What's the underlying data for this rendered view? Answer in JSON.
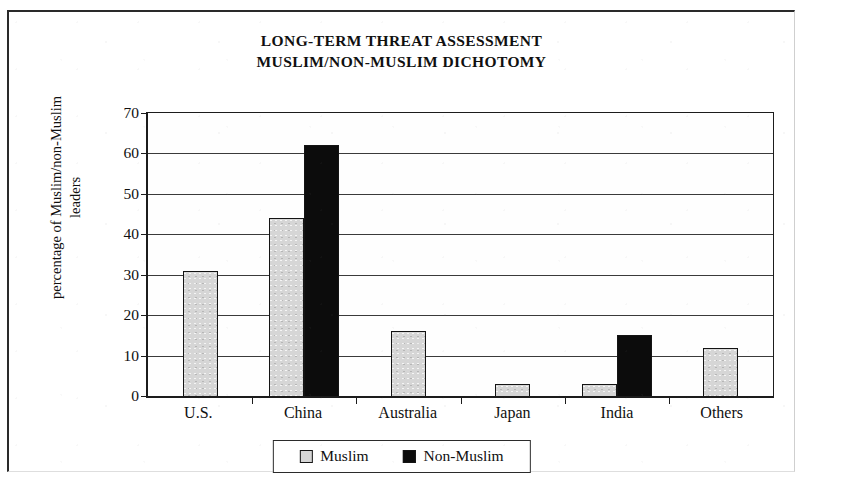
{
  "chart_data": {
    "type": "bar",
    "title": "LONG-TERM THREAT ASSESSMENT MUSLIM/NON-MUSLIM DICHOTOMY",
    "title_lines": [
      "LONG-TERM THREAT ASSESSMENT",
      "MUSLIM/NON-MUSLIM DICHOTOMY"
    ],
    "xlabel": "",
    "ylabel": "percentage of Muslim/non-Muslim leaders",
    "ylabel_lines": [
      "percentage of Muslim/non-Muslim",
      "leaders"
    ],
    "categories": [
      "U.S.",
      "China",
      "Australia",
      "Japan",
      "India",
      "Others"
    ],
    "series": [
      {
        "name": "Muslim",
        "color": "#d6d6d6",
        "values": [
          31,
          44,
          16,
          3,
          3,
          12
        ]
      },
      {
        "name": "Non-Muslim",
        "color": "#0c0c0c",
        "values": [
          null,
          62,
          null,
          null,
          15,
          null
        ]
      }
    ],
    "ylim": [
      0,
      70
    ],
    "ytick_step": 10,
    "yticks": [
      70,
      60,
      50,
      40,
      30,
      20,
      10,
      0
    ],
    "grid": true,
    "legend_position": "bottom-center"
  },
  "legend": {
    "items": [
      {
        "label": "Muslim",
        "swatch": "muslim"
      },
      {
        "label": "Non-Muslim",
        "swatch": "nonmuslim"
      }
    ]
  }
}
